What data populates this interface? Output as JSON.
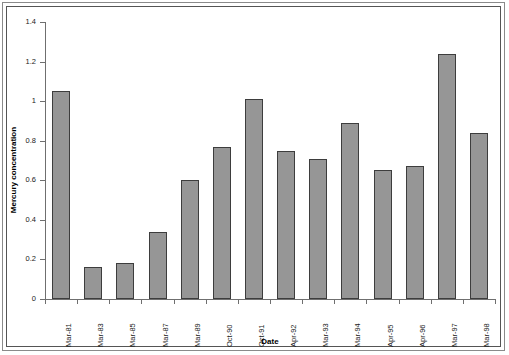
{
  "chart_data": {
    "type": "bar",
    "title": "",
    "xlabel": "Date",
    "ylabel": "Mercury concentration",
    "categories": [
      "Mar-81",
      "Mar-83",
      "Mar-85",
      "Mar-87",
      "Mar-89",
      "Oct-90",
      "Oct-91",
      "Apr-92",
      "Mar-93",
      "Mar-94",
      "Apr-95",
      "Apr-96",
      "Mar-97",
      "Mar-98"
    ],
    "values": [
      1.05,
      0.16,
      0.18,
      0.34,
      0.6,
      0.77,
      1.01,
      0.75,
      0.71,
      0.89,
      0.65,
      0.67,
      1.24,
      0.84
    ],
    "ylim": [
      0,
      1.4
    ],
    "ytick_labels": [
      "0",
      "0.2",
      "0.4",
      "0.6",
      "0.8",
      "1",
      "1.2",
      "1.4"
    ],
    "ytick_values": [
      0,
      0.2,
      0.4,
      0.6,
      0.8,
      1.0,
      1.2,
      1.4
    ],
    "grid": false,
    "legend": null,
    "series_color": "#969696",
    "series_edge_color": "#3d3d3d",
    "axis_color": "#6f6f6f"
  }
}
